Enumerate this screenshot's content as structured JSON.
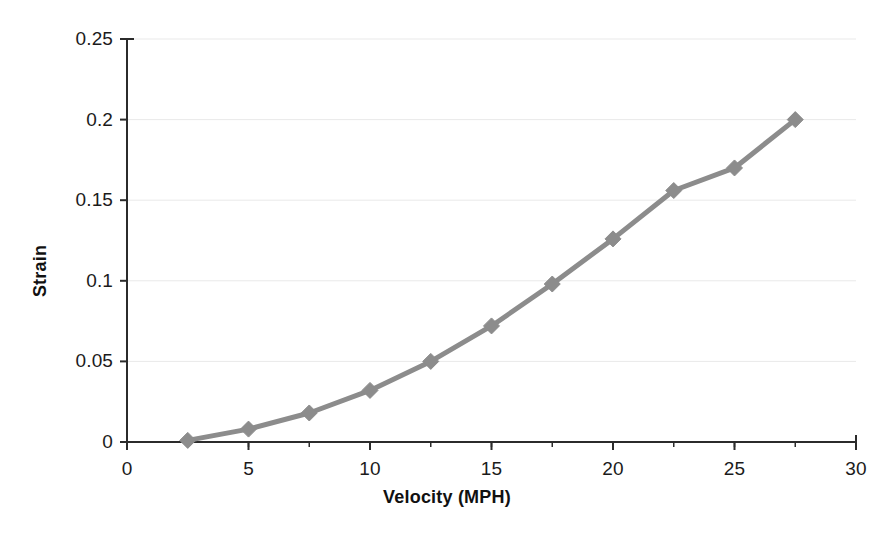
{
  "chart_data": {
    "type": "line",
    "title": "",
    "xlabel": "Velocity (MPH)",
    "ylabel": "Strain",
    "xlim": [
      0,
      30
    ],
    "ylim": [
      0,
      0.25
    ],
    "xticks": [
      "0",
      "5",
      "10",
      "15",
      "20",
      "25",
      "30"
    ],
    "xtick_values": [
      0,
      5,
      10,
      15,
      20,
      25,
      30
    ],
    "yticks": [
      "0",
      "0.05",
      "0.1",
      "0.15",
      "0.2",
      "0.25"
    ],
    "ytick_values": [
      0,
      0.05,
      0.1,
      0.15,
      0.2,
      0.25
    ],
    "grid": "horizontal",
    "legend": "none",
    "series": [
      {
        "name": "Strain vs Velocity",
        "color": "#8c8c8c",
        "marker": "diamond",
        "x": [
          2.5,
          5,
          7.5,
          10,
          12.5,
          15,
          17.5,
          20,
          22.5,
          25,
          27.5
        ],
        "values": [
          0.001,
          0.008,
          0.018,
          0.032,
          0.05,
          0.072,
          0.098,
          0.126,
          0.156,
          0.17,
          0.2
        ]
      }
    ]
  },
  "style": {
    "line_color": "#8c8c8c",
    "marker_color": "#8c8c8c",
    "axis_color": "#2b2b2b",
    "grid_color": "#e9e9e9",
    "background": "#ffffff"
  }
}
